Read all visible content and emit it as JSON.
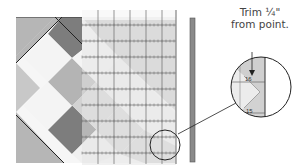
{
  "caption": {
    "line1": "Trim ¼\"",
    "line2": "from point."
  },
  "magnifier": {
    "upper_mark": "16",
    "lower_mark": "15"
  },
  "colors": {
    "dark": "#7a7a7a",
    "medium": "#b4b4b4",
    "light": "#f4f4f4",
    "ruler": "#dcdcdc",
    "cutter": "#8c8c8c",
    "outline": "#222222"
  }
}
